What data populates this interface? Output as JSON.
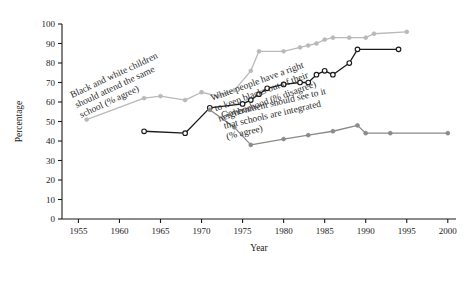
{
  "chart_data": {
    "type": "line",
    "title": "",
    "xlabel": "Year",
    "ylabel": "Percentage",
    "xlim": [
      1953,
      2001
    ],
    "ylim": [
      0,
      100
    ],
    "grid": false,
    "legend_position": "inline-annotations",
    "xticks": [
      "1955",
      "1960",
      "1965",
      "1970",
      "1975",
      "1980",
      "1985",
      "1990",
      "1995",
      "2000"
    ],
    "yticks": [
      "0",
      "10",
      "20",
      "30",
      "40",
      "50",
      "60",
      "70",
      "80",
      "90",
      "100"
    ],
    "series": [
      {
        "name": "Black and white children should attend the same school (% agree)",
        "color": "#b9b9b9",
        "marker": "filled-circle",
        "annotation": {
          "line1": "Black and white children",
          "line2": "should attend the same",
          "line3": "school (% agree)"
        },
        "points": [
          {
            "x": 1956,
            "y": 51
          },
          {
            "x": 1963,
            "y": 62
          },
          {
            "x": 1965,
            "y": 63
          },
          {
            "x": 1968,
            "y": 61
          },
          {
            "x": 1970,
            "y": 65
          },
          {
            "x": 1972,
            "y": 63
          },
          {
            "x": 1974,
            "y": 66
          },
          {
            "x": 1976,
            "y": 76
          },
          {
            "x": 1977,
            "y": 86
          },
          {
            "x": 1980,
            "y": 86
          },
          {
            "x": 1982,
            "y": 88
          },
          {
            "x": 1983,
            "y": 89
          },
          {
            "x": 1984,
            "y": 90
          },
          {
            "x": 1985,
            "y": 92
          },
          {
            "x": 1986,
            "y": 93
          },
          {
            "x": 1988,
            "y": 93
          },
          {
            "x": 1990,
            "y": 93
          },
          {
            "x": 1991,
            "y": 95
          },
          {
            "x": 1995,
            "y": 96
          }
        ]
      },
      {
        "name": "White people have a right to keep blacks out of their neighborhood (% disagree)",
        "color": "#1a1a1a",
        "marker": "open-circle",
        "annotation": {
          "line1": "White people have a right",
          "line2": "to keep blacks out of their",
          "line3": "neighborhood (% disagree)"
        },
        "points": [
          {
            "x": 1963,
            "y": 45
          },
          {
            "x": 1968,
            "y": 44
          },
          {
            "x": 1971,
            "y": 57
          },
          {
            "x": 1975,
            "y": 59
          },
          {
            "x": 1976,
            "y": 61
          },
          {
            "x": 1977,
            "y": 64
          },
          {
            "x": 1978,
            "y": 67
          },
          {
            "x": 1980,
            "y": 69
          },
          {
            "x": 1982,
            "y": 70
          },
          {
            "x": 1983,
            "y": 70
          },
          {
            "x": 1984,
            "y": 74
          },
          {
            "x": 1985,
            "y": 76
          },
          {
            "x": 1986,
            "y": 74
          },
          {
            "x": 1988,
            "y": 80
          },
          {
            "x": 1989,
            "y": 87
          },
          {
            "x": 1994,
            "y": 87
          }
        ]
      },
      {
        "name": "Government should see to it that schools are integrated (% agree)",
        "color": "#8a8a8a",
        "marker": "filled-circle",
        "annotation": {
          "line1": "Government should see to it",
          "line2": "that schools are integrated",
          "line3": "(% agree)"
        },
        "points": [
          {
            "x": 1971,
            "y": 56
          },
          {
            "x": 1974,
            "y": 47
          },
          {
            "x": 1976,
            "y": 38
          },
          {
            "x": 1980,
            "y": 41
          },
          {
            "x": 1983,
            "y": 43
          },
          {
            "x": 1986,
            "y": 45
          },
          {
            "x": 1989,
            "y": 48
          },
          {
            "x": 1990,
            "y": 44
          },
          {
            "x": 1993,
            "y": 44
          },
          {
            "x": 2000,
            "y": 44
          }
        ]
      }
    ]
  }
}
